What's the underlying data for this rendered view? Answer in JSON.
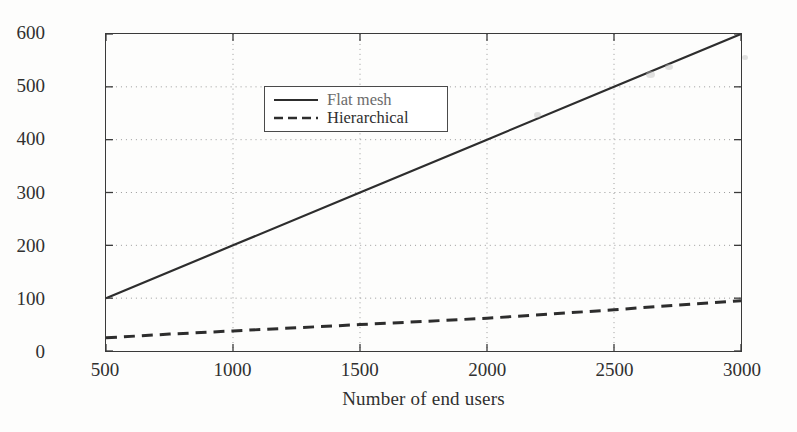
{
  "chart_data": {
    "type": "line",
    "title": "",
    "subtitle": "",
    "xlabel": "Number of end users",
    "ylabel": "Routine table entries",
    "xlim": [
      500,
      3000
    ],
    "ylim": [
      0,
      600
    ],
    "xticks": [
      500,
      1000,
      1500,
      2000,
      2500,
      3000
    ],
    "yticks": [
      0,
      100,
      200,
      300,
      400,
      500,
      600
    ],
    "xtick_labels": [
      "500",
      "1000",
      "1500",
      "2000",
      "2500",
      "3000"
    ],
    "ytick_labels": [
      "0",
      "100",
      "200",
      "300",
      "400",
      "500",
      "600"
    ],
    "grid": true,
    "grid_style": "dotted",
    "legend_position": "upper left",
    "series": [
      {
        "name": "Flat mesh",
        "style": "solid",
        "color": "#2d2d2d",
        "x": [
          500,
          1000,
          1500,
          2000,
          2500,
          3000
        ],
        "values": [
          100,
          200,
          300,
          400,
          500,
          600
        ]
      },
      {
        "name": "Hierarchical",
        "style": "dashed",
        "color": "#2d2d2d",
        "x": [
          500,
          750,
          1000,
          1250,
          1500,
          1750,
          2000,
          2250,
          2500,
          2750,
          3000
        ],
        "values": [
          25,
          32,
          38,
          44,
          50,
          56,
          62,
          70,
          78,
          87,
          95
        ]
      }
    ]
  },
  "axis": {
    "ylabel": "Routine table entries",
    "xlabel": "Number of end users"
  },
  "legend": {
    "items": [
      {
        "label": "Flat mesh",
        "style": "solid"
      },
      {
        "label": "Hierarchical",
        "style": "dashed"
      }
    ]
  }
}
